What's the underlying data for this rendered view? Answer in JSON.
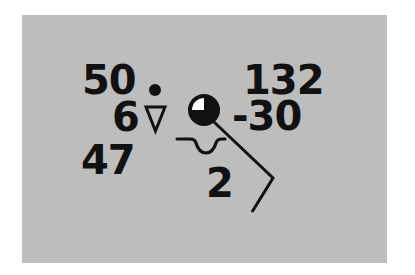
{
  "station_model": {
    "temperature": "50",
    "visibility": "6",
    "dew_point": "47",
    "pressure": "132",
    "pressure_change": "-30",
    "past_weather": "2",
    "present_weather_icon": "rain-shower-icon",
    "sky_cover_icon": "sky-cover-three-quarters-icon",
    "wind_icon": "wind-barb-icon",
    "low_cloud_icon": "cumulus-cloud-icon"
  },
  "colors": {
    "background": "#ffffff",
    "panel": "#bdbdbd",
    "ink": "#111111"
  }
}
